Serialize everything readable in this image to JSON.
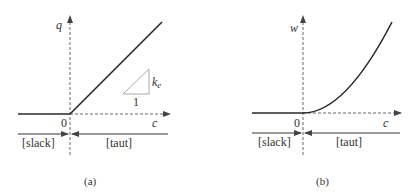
{
  "panels": [
    {
      "id": "a",
      "caption": "(a)",
      "y_label": "q",
      "x_label": "c",
      "origin_label": "0",
      "slope_label": "k",
      "slope_sub": "e",
      "run_label": "1",
      "region_left": "[slack]",
      "region_right": "[taut]",
      "curve": "linear (zero for c<0, slope k_e for c>0)"
    },
    {
      "id": "b",
      "caption": "(b)",
      "y_label": "w",
      "x_label": "c",
      "origin_label": "0",
      "region_left": "[slack]",
      "region_right": "[taut]",
      "curve": "quadratic (zero for c<0, rising for c>0)"
    }
  ],
  "colors": {
    "line": "#2a2a2a",
    "axis": "#666666",
    "triangle": "#aaaaaa"
  }
}
